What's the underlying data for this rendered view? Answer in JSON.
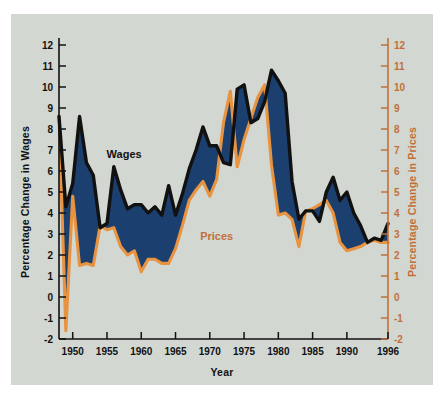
{
  "chart_data": {
    "type": "area",
    "title": "",
    "subtitle": "",
    "xlabel": "Year",
    "ylabel_left": "Percentage Change in Wages",
    "ylabel_right": "Percentage Change in Prices",
    "xlim": [
      1948,
      1996
    ],
    "ylim": [
      -2,
      12
    ],
    "y_ticks": [
      12,
      11,
      10,
      9,
      8,
      7,
      6,
      5,
      4,
      3,
      2,
      1,
      0,
      -1,
      -2
    ],
    "y_tick_labels": [
      "12",
      "11",
      "10",
      "9",
      "8",
      "7",
      "6",
      "5",
      "4",
      "3",
      "2",
      "1",
      "0",
      "-1",
      "-2"
    ],
    "x_ticks": [
      1950,
      1955,
      1960,
      1965,
      1970,
      1975,
      1980,
      1985,
      1990,
      1996
    ],
    "x_tick_labels": [
      "1950",
      "1955",
      "1960",
      "1965",
      "1970",
      "1975",
      "1980",
      "1985",
      "1990",
      "1996"
    ],
    "grid": false,
    "legend_position": "inline-annotations",
    "annotations": [
      {
        "text": "Wages",
        "x": 1957.5,
        "y": 6.6,
        "color": "#111111"
      },
      {
        "text": "Prices",
        "x": 1971.0,
        "y": 2.7,
        "color": "#d98c4a"
      }
    ],
    "colors": {
      "wages_line": "#111111",
      "prices_line": "#e8933f",
      "fill_between": "#1b3f6e",
      "background": "#d3d7d1",
      "left_axis_text": "#111111",
      "right_axis_text": "#c2703a"
    },
    "x": [
      1948,
      1949,
      1950,
      1951,
      1952,
      1953,
      1954,
      1955,
      1956,
      1957,
      1958,
      1959,
      1960,
      1961,
      1962,
      1963,
      1964,
      1965,
      1966,
      1967,
      1968,
      1969,
      1970,
      1971,
      1972,
      1973,
      1974,
      1975,
      1976,
      1977,
      1978,
      1979,
      1980,
      1981,
      1982,
      1983,
      1984,
      1985,
      1986,
      1987,
      1988,
      1989,
      1990,
      1991,
      1992,
      1993,
      1994,
      1995,
      1996
    ],
    "series": [
      {
        "name": "Wages",
        "color": "#111111",
        "axis": "left",
        "values": [
          8.6,
          4.3,
          5.4,
          8.6,
          6.4,
          5.8,
          3.3,
          3.5,
          6.2,
          5.1,
          4.2,
          4.4,
          4.4,
          4.0,
          4.3,
          3.9,
          5.3,
          3.9,
          4.9,
          6.1,
          7.0,
          8.1,
          7.2,
          7.2,
          6.4,
          6.3,
          9.9,
          10.1,
          8.3,
          8.5,
          9.3,
          10.8,
          10.3,
          9.7,
          5.5,
          3.7,
          4.1,
          4.1,
          3.6,
          5.0,
          5.7,
          4.6,
          5.0,
          4.0,
          3.4,
          2.6,
          2.8,
          2.7,
          3.5
        ]
      },
      {
        "name": "Prices",
        "color": "#e8933f",
        "axis": "right",
        "values": [
          8.6,
          -1.6,
          4.8,
          1.5,
          1.6,
          1.5,
          3.4,
          3.2,
          3.3,
          2.4,
          2.0,
          2.2,
          1.2,
          1.8,
          1.8,
          1.6,
          1.6,
          2.3,
          3.4,
          4.6,
          5.1,
          5.5,
          4.8,
          5.6,
          8.3,
          9.8,
          6.2,
          7.5,
          8.5,
          9.5,
          10.1,
          6.3,
          3.9,
          4.0,
          3.7,
          2.4,
          4.1,
          4.2,
          4.4,
          4.6,
          4.0,
          2.6,
          2.2,
          2.3,
          2.4,
          2.6,
          2.7,
          2.6,
          2.6
        ]
      }
    ]
  },
  "figure": {
    "left_axis_label": "Percentage Change in Wages",
    "right_axis_label": "Percentage Change in Prices",
    "x_axis_label": "Year",
    "wages_annotation": "Wages",
    "prices_annotation": "Prices"
  }
}
